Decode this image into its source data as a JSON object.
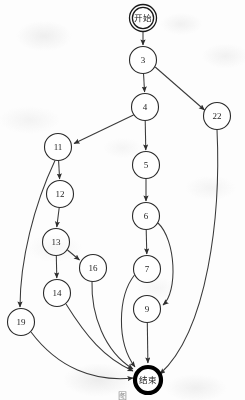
{
  "figure": {
    "kind": "flowchart",
    "orientation": "top-to-bottom",
    "background_color": "#fdfdfd",
    "stroke_color": "#3a3a3a",
    "node_fill": "#ffffff",
    "end_node_stroke": "#000000"
  },
  "nodes": [
    {
      "id": "start",
      "label": "开始",
      "x": 143,
      "y": 18,
      "r": 13.5,
      "shape": "double-circle",
      "is_cjk": true
    },
    {
      "id": "n3",
      "label": "3",
      "x": 143,
      "y": 60,
      "r": 13.5,
      "shape": "circle",
      "is_cjk": false
    },
    {
      "id": "n4",
      "label": "4",
      "x": 145,
      "y": 107,
      "r": 13.5,
      "shape": "circle",
      "is_cjk": false
    },
    {
      "id": "n22",
      "label": "22",
      "x": 217,
      "y": 116,
      "r": 13.5,
      "shape": "circle",
      "is_cjk": false
    },
    {
      "id": "n11",
      "label": "11",
      "x": 58,
      "y": 147,
      "r": 13.5,
      "shape": "circle",
      "is_cjk": false
    },
    {
      "id": "n5",
      "label": "5",
      "x": 146,
      "y": 165,
      "r": 13.5,
      "shape": "circle",
      "is_cjk": false
    },
    {
      "id": "n12",
      "label": "12",
      "x": 60,
      "y": 194,
      "r": 13.5,
      "shape": "circle",
      "is_cjk": false
    },
    {
      "id": "n6",
      "label": "6",
      "x": 146,
      "y": 216,
      "r": 13.5,
      "shape": "circle",
      "is_cjk": false
    },
    {
      "id": "n13",
      "label": "13",
      "x": 56,
      "y": 242,
      "r": 13.5,
      "shape": "circle",
      "is_cjk": false
    },
    {
      "id": "n16",
      "label": "16",
      "x": 93,
      "y": 268,
      "r": 13.5,
      "shape": "circle",
      "is_cjk": false
    },
    {
      "id": "n7",
      "label": "7",
      "x": 147,
      "y": 269,
      "r": 13.5,
      "shape": "circle",
      "is_cjk": false
    },
    {
      "id": "n14",
      "label": "14",
      "x": 57,
      "y": 293,
      "r": 13.5,
      "shape": "circle",
      "is_cjk": false
    },
    {
      "id": "n9",
      "label": "9",
      "x": 147,
      "y": 309,
      "r": 13.5,
      "shape": "circle",
      "is_cjk": false
    },
    {
      "id": "n19",
      "label": "19",
      "x": 21,
      "y": 322,
      "r": 13.5,
      "shape": "circle",
      "is_cjk": false
    },
    {
      "id": "end",
      "label": "结束",
      "x": 148,
      "y": 380,
      "r": 14.5,
      "shape": "thick-circle",
      "is_cjk": true
    }
  ],
  "edges": [
    {
      "from": "start",
      "to": "n3",
      "style": "straight",
      "arrow": true
    },
    {
      "from": "n3",
      "to": "n4",
      "style": "straight",
      "arrow": true
    },
    {
      "from": "n3",
      "to": "n22",
      "style": "straight",
      "arrow": true
    },
    {
      "from": "n4",
      "to": "n5",
      "style": "straight",
      "arrow": true
    },
    {
      "from": "n4",
      "to": "n11",
      "style": "straight",
      "arrow": true
    },
    {
      "from": "n11",
      "to": "n12",
      "style": "straight",
      "arrow": true
    },
    {
      "from": "n11",
      "to": "n19",
      "style": "curved",
      "arrow": true
    },
    {
      "from": "n12",
      "to": "n13",
      "style": "straight",
      "arrow": true
    },
    {
      "from": "n13",
      "to": "n14",
      "style": "straight",
      "arrow": true
    },
    {
      "from": "n13",
      "to": "n16",
      "style": "straight",
      "arrow": true
    },
    {
      "from": "n5",
      "to": "n6",
      "style": "straight",
      "arrow": true
    },
    {
      "from": "n6",
      "to": "n7",
      "style": "straight",
      "arrow": true
    },
    {
      "from": "n6",
      "to": "n9",
      "style": "curved",
      "arrow": true
    },
    {
      "from": "n9",
      "to": "end",
      "style": "straight",
      "arrow": true
    },
    {
      "from": "n7",
      "to": "end",
      "style": "curved",
      "arrow": true
    },
    {
      "from": "n14",
      "to": "end",
      "style": "curved",
      "arrow": true
    },
    {
      "from": "n16",
      "to": "end",
      "style": "curved",
      "arrow": true
    },
    {
      "from": "n19",
      "to": "end",
      "style": "curved",
      "arrow": true
    },
    {
      "from": "n22",
      "to": "end",
      "style": "curved",
      "arrow": true
    }
  ],
  "caption": {
    "text": "图"
  }
}
